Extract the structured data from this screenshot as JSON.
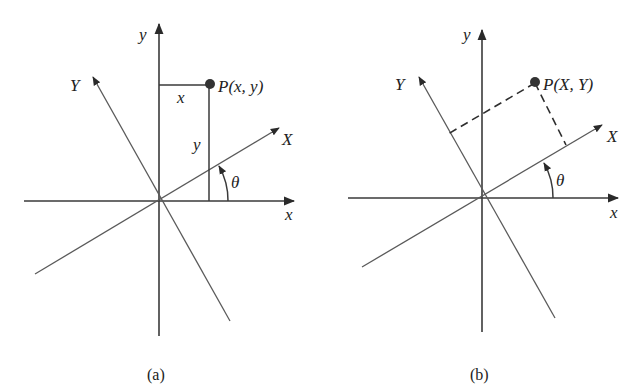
{
  "figure": {
    "panels": [
      {
        "id": "a",
        "caption": "(a)",
        "labels": {
          "x_axis": "x",
          "y_axis": "y",
          "X_axis": "X",
          "Y_axis": "Y",
          "point": "P(x, y)",
          "proj_x": "x",
          "proj_y": "y",
          "angle": "θ"
        },
        "projection_style": "solid"
      },
      {
        "id": "b",
        "caption": "(b)",
        "labels": {
          "x_axis": "x",
          "y_axis": "y",
          "X_axis": "X",
          "Y_axis": "Y",
          "point": "P(X, Y)",
          "angle": "θ"
        },
        "projection_style": "dashed"
      }
    ],
    "colors": {
      "axis": "#3a3a3a",
      "rotated_axis": "#5a5a5a",
      "point": "#333333",
      "background": "#ffffff"
    }
  }
}
